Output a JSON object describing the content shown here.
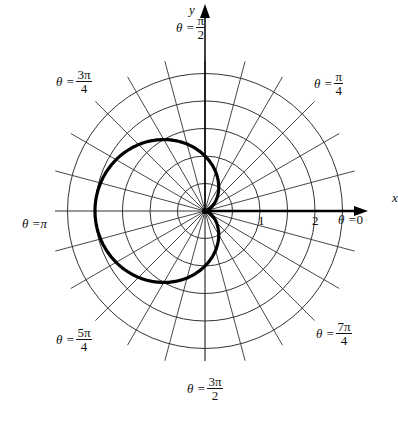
{
  "diagram": {
    "type": "polar graph",
    "curve": "r = 1 - cos(theta)",
    "axis_labels": {
      "x": "x",
      "y": "y"
    },
    "radial_ticks": [
      "1",
      "2"
    ],
    "angle_labels": [
      {
        "id": "a0",
        "prefix": "θ = ",
        "value": "0",
        "num": "",
        "den": ""
      },
      {
        "id": "a90",
        "prefix": "θ = ",
        "num": "π",
        "den": "2"
      },
      {
        "id": "a45",
        "prefix": "θ = ",
        "num": "π",
        "den": "4"
      },
      {
        "id": "a135",
        "prefix": "θ = ",
        "num": "3π",
        "den": "4"
      },
      {
        "id": "a180",
        "prefix": "θ = ",
        "value": "π",
        "num": "",
        "den": ""
      },
      {
        "id": "a225",
        "prefix": "θ = ",
        "num": "5π",
        "den": "4"
      },
      {
        "id": "a270",
        "prefix": "θ = ",
        "num": "3π",
        "den": "2"
      },
      {
        "id": "a315",
        "prefix": "θ = ",
        "num": "7π",
        "den": "4"
      }
    ],
    "colors": {
      "grid": "#333333",
      "curve": "#000000",
      "background": "#ffffff"
    }
  }
}
